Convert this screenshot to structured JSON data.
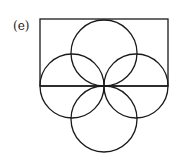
{
  "figure": {
    "label": "(e)",
    "stroke_color": "#1a1a1a",
    "background": "#ffffff",
    "rectangle": {
      "x": 40,
      "y": 19,
      "width": 128,
      "height": 67
    },
    "baseline": {
      "x1": 40,
      "y1": 86,
      "x2": 168,
      "y2": 86
    },
    "circles": [
      {
        "name": "top",
        "cx": 104,
        "cy": 53,
        "r": 33
      },
      {
        "name": "left",
        "cx": 72,
        "cy": 86,
        "r": 32
      },
      {
        "name": "right",
        "cx": 136,
        "cy": 86,
        "r": 32
      },
      {
        "name": "bottom",
        "cx": 104,
        "cy": 119,
        "r": 33
      }
    ]
  }
}
